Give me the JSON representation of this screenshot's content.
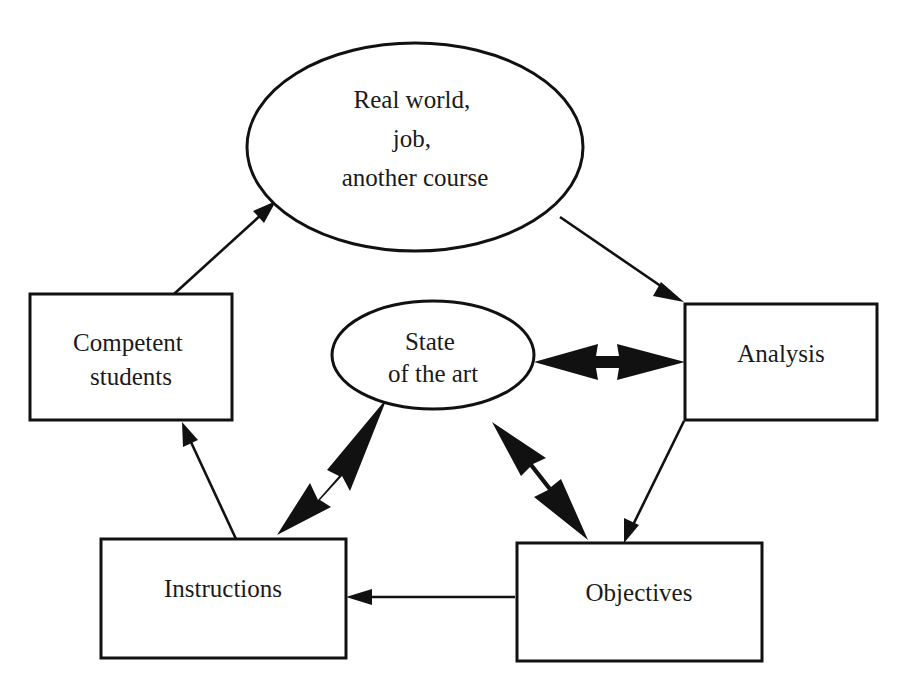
{
  "diagram": {
    "type": "instructional-design-cycle",
    "colors": {
      "stroke": "#111111",
      "background": "#ffffff",
      "text": "#1a1a1a"
    },
    "nodes": {
      "real_world": {
        "shape": "ellipse",
        "lines": [
          "Real world,",
          "job,",
          "another course"
        ]
      },
      "state_of_art": {
        "shape": "ellipse",
        "lines": [
          "State",
          "of the art"
        ]
      },
      "competent": {
        "shape": "rectangle",
        "lines": [
          "Competent",
          "students"
        ]
      },
      "analysis": {
        "shape": "rectangle",
        "lines": [
          "Analysis"
        ]
      },
      "instructions": {
        "shape": "rectangle",
        "lines": [
          "Instructions"
        ]
      },
      "objectives": {
        "shape": "rectangle",
        "lines": [
          "Objectives"
        ]
      }
    },
    "edges": [
      {
        "from": "Competent students",
        "to": "Real world, job, another course",
        "style": "single"
      },
      {
        "from": "Real world, job, another course",
        "to": "Analysis",
        "style": "single"
      },
      {
        "from": "Analysis",
        "to": "Objectives",
        "style": "single"
      },
      {
        "from": "Objectives",
        "to": "Instructions",
        "style": "single"
      },
      {
        "from": "Instructions",
        "to": "Competent students",
        "style": "single"
      },
      {
        "from": "State of the art",
        "to": "Analysis",
        "style": "double-thick"
      },
      {
        "from": "State of the art",
        "to": "Instructions",
        "style": "double-thick"
      },
      {
        "from": "State of the art",
        "to": "Objectives",
        "style": "double-thick"
      }
    ]
  }
}
